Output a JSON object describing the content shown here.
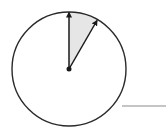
{
  "diagram": {
    "type": "circle-with-sector",
    "circle": {
      "cx": 69,
      "cy": 69,
      "r": 57,
      "stroke": "#2a2a2a"
    },
    "center_dot": {
      "r": 2.5,
      "fill": "#1a1a1a"
    },
    "vectors": [
      {
        "name": "vertical-arrow",
        "angle_deg_from_vertical": 0
      },
      {
        "name": "angled-arrow",
        "angle_deg_from_vertical": 30
      }
    ],
    "sector": {
      "from_deg": 0,
      "to_deg": 30,
      "fill": "#e6e6e6"
    },
    "answer_line": {
      "x1": 122,
      "x2": 166,
      "y": 106,
      "stroke": "#8a8a8a"
    }
  }
}
